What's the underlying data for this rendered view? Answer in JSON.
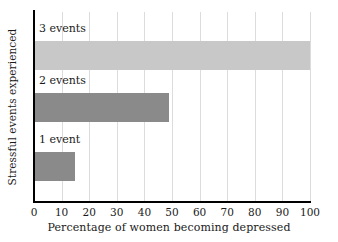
{
  "chart_data": {
    "type": "bar",
    "orientation": "horizontal",
    "title": "",
    "xlabel": "Percentage of women becoming depressed",
    "ylabel": "Stressful events experienced",
    "categories": [
      "1 event",
      "2 events",
      "3 events"
    ],
    "values": [
      15,
      49,
      100
    ],
    "xlim": [
      0,
      100
    ],
    "xticks": [
      0,
      10,
      20,
      30,
      40,
      50,
      60,
      70,
      80,
      90,
      100
    ],
    "xtick_labels": [
      "0",
      "10",
      "20",
      "30",
      "40",
      "50",
      "60",
      "70",
      "80",
      "90",
      "100"
    ],
    "grid": true,
    "grid_axis": "x",
    "legend": false,
    "bar_colors": [
      "#8a8a8a",
      "#8a8a8a",
      "#c8c8c8"
    ],
    "axis_color": "#000000",
    "grid_color": "#dcdcdc",
    "background": "#ffffff",
    "label_position": "above-bar",
    "series": [
      {
        "name": "Percentage of women becoming depressed",
        "points": [
          {
            "category": "3 events",
            "value": 100,
            "color": "#c8c8c8"
          },
          {
            "category": "2 events",
            "value": 49,
            "color": "#8a8a8a"
          },
          {
            "category": "1 event",
            "value": 15,
            "color": "#8a8a8a"
          }
        ]
      }
    ]
  }
}
